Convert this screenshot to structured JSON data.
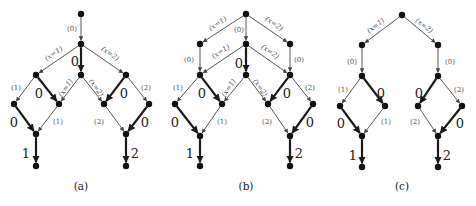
{
  "figure": {
    "panels": [
      {
        "id": "a",
        "caption": "(a)",
        "caption_pos": [
          81,
          187
        ],
        "nodes": [
          [
            81,
            14
          ],
          [
            81,
            44
          ],
          [
            36,
            75
          ],
          [
            81,
            75
          ],
          [
            126,
            75
          ],
          [
            14,
            104
          ],
          [
            59,
            104
          ],
          [
            104,
            104
          ],
          [
            149,
            104
          ],
          [
            36,
            134
          ],
          [
            126,
            134
          ],
          [
            36,
            166
          ],
          [
            126,
            166
          ]
        ],
        "edges": [
          {
            "from": 0,
            "to": 1,
            "w": "thin",
            "label": "(0)",
            "lx": 72,
            "ly": 29,
            "rot": 0,
            "size": "small"
          },
          {
            "from": 1,
            "to": 2,
            "w": "thin",
            "label": "(x=1)",
            "lx": 54,
            "ly": 54,
            "rot": -34,
            "size": "small"
          },
          {
            "from": 1,
            "to": 3,
            "w": "thick",
            "label": "0",
            "lx": 75,
            "ly": 62,
            "rot": 0,
            "size": "big"
          },
          {
            "from": 1,
            "to": 4,
            "w": "thin",
            "label": "(x=2)",
            "lx": 110,
            "ly": 54,
            "rot": 34,
            "size": "small"
          },
          {
            "from": 2,
            "to": 5,
            "w": "thin",
            "label": "(1)",
            "lx": 16,
            "ly": 88,
            "rot": 0,
            "size": "small"
          },
          {
            "from": 2,
            "to": 6,
            "w": "thick",
            "label": "0",
            "lx": 39,
            "ly": 94,
            "rot": 0,
            "size": "big"
          },
          {
            "from": 3,
            "to": 6,
            "w": "thin",
            "label": "(x=1)",
            "lx": 66,
            "ly": 88,
            "rot": -55,
            "size": "small"
          },
          {
            "from": 3,
            "to": 7,
            "w": "thin",
            "label": "(x=2)",
            "lx": 96,
            "ly": 88,
            "rot": 55,
            "size": "small"
          },
          {
            "from": 4,
            "to": 7,
            "w": "thick",
            "label": "0",
            "lx": 124,
            "ly": 94,
            "rot": 0,
            "size": "big"
          },
          {
            "from": 4,
            "to": 8,
            "w": "thin",
            "label": "(2)",
            "lx": 146,
            "ly": 88,
            "rot": 0,
            "size": "small"
          },
          {
            "from": 5,
            "to": 9,
            "w": "thick",
            "label": "0",
            "lx": 14,
            "ly": 123,
            "rot": 0,
            "size": "big"
          },
          {
            "from": 6,
            "to": 9,
            "w": "thin",
            "label": "(1)",
            "lx": 58,
            "ly": 122,
            "rot": 0,
            "size": "small"
          },
          {
            "from": 7,
            "to": 10,
            "w": "thin",
            "label": "(2)",
            "lx": 99,
            "ly": 122,
            "rot": 0,
            "size": "small"
          },
          {
            "from": 8,
            "to": 10,
            "w": "thick",
            "label": "0",
            "lx": 145,
            "ly": 123,
            "rot": 0,
            "size": "big"
          },
          {
            "from": 9,
            "to": 11,
            "w": "thick",
            "label": "1",
            "lx": 26,
            "ly": 154,
            "rot": 0,
            "size": "big"
          },
          {
            "from": 10,
            "to": 12,
            "w": "thick",
            "label": "2",
            "lx": 135,
            "ly": 154,
            "rot": 0,
            "size": "big"
          }
        ]
      },
      {
        "id": "b",
        "caption": "(b)",
        "caption_pos": [
          246,
          187
        ],
        "nodes": [
          [
            246,
            14
          ],
          [
            200,
            44
          ],
          [
            246,
            44
          ],
          [
            290,
            44
          ],
          [
            200,
            75
          ],
          [
            246,
            75
          ],
          [
            290,
            75
          ],
          [
            175,
            104
          ],
          [
            222,
            104
          ],
          [
            268,
            104
          ],
          [
            313,
            104
          ],
          [
            200,
            136
          ],
          [
            290,
            136
          ],
          [
            200,
            166
          ],
          [
            290,
            166
          ]
        ],
        "edges": [
          {
            "from": 0,
            "to": 1,
            "w": "thin",
            "label": "(x=1)",
            "lx": 218,
            "ly": 24,
            "rot": -34,
            "size": "small"
          },
          {
            "from": 0,
            "to": 2,
            "w": "thin",
            "label": "(0)",
            "lx": 239,
            "ly": 30,
            "rot": 0,
            "size": "small"
          },
          {
            "from": 0,
            "to": 3,
            "w": "thin",
            "label": "(x=2)",
            "lx": 274,
            "ly": 24,
            "rot": 34,
            "size": "small"
          },
          {
            "from": 1,
            "to": 4,
            "w": "thin",
            "label": "(0)",
            "lx": 189,
            "ly": 60,
            "rot": 0,
            "size": "small"
          },
          {
            "from": 2,
            "to": 4,
            "w": "thin",
            "label": "(x=1)",
            "lx": 221,
            "ly": 52,
            "rot": -34,
            "size": "small"
          },
          {
            "from": 2,
            "to": 5,
            "w": "thick",
            "label": "0",
            "lx": 239,
            "ly": 64,
            "rot": 0,
            "size": "big"
          },
          {
            "from": 2,
            "to": 6,
            "w": "thin",
            "label": "(x=2)",
            "lx": 270,
            "ly": 52,
            "rot": 34,
            "size": "small"
          },
          {
            "from": 3,
            "to": 6,
            "w": "thin",
            "label": "(0)",
            "lx": 299,
            "ly": 60,
            "rot": 0,
            "size": "small"
          },
          {
            "from": 4,
            "to": 7,
            "w": "thin",
            "label": "(1)",
            "lx": 178,
            "ly": 88,
            "rot": 0,
            "size": "small"
          },
          {
            "from": 4,
            "to": 8,
            "w": "thick",
            "label": "0",
            "lx": 202,
            "ly": 94,
            "rot": 0,
            "size": "big"
          },
          {
            "from": 5,
            "to": 8,
            "w": "thin",
            "label": "(x=1)",
            "lx": 229,
            "ly": 88,
            "rot": -55,
            "size": "small"
          },
          {
            "from": 5,
            "to": 9,
            "w": "thin",
            "label": "(x=2)",
            "lx": 260,
            "ly": 88,
            "rot": 55,
            "size": "small"
          },
          {
            "from": 6,
            "to": 9,
            "w": "thick",
            "label": "0",
            "lx": 287,
            "ly": 94,
            "rot": 0,
            "size": "big"
          },
          {
            "from": 6,
            "to": 10,
            "w": "thin",
            "label": "(2)",
            "lx": 310,
            "ly": 88,
            "rot": 0,
            "size": "small"
          },
          {
            "from": 7,
            "to": 11,
            "w": "thick",
            "label": "0",
            "lx": 175,
            "ly": 123,
            "rot": 0,
            "size": "big"
          },
          {
            "from": 8,
            "to": 11,
            "w": "thin",
            "label": "(1)",
            "lx": 222,
            "ly": 122,
            "rot": 0,
            "size": "small"
          },
          {
            "from": 9,
            "to": 12,
            "w": "thin",
            "label": "(2)",
            "lx": 267,
            "ly": 122,
            "rot": 0,
            "size": "small"
          },
          {
            "from": 10,
            "to": 12,
            "w": "thick",
            "label": "0",
            "lx": 310,
            "ly": 123,
            "rot": 0,
            "size": "big"
          },
          {
            "from": 11,
            "to": 13,
            "w": "thick",
            "label": "1",
            "lx": 190,
            "ly": 154,
            "rot": 0,
            "size": "big"
          },
          {
            "from": 12,
            "to": 14,
            "w": "thick",
            "label": "2",
            "lx": 299,
            "ly": 154,
            "rot": 0,
            "size": "big"
          }
        ]
      },
      {
        "id": "c",
        "caption": "(c)",
        "caption_pos": [
          402,
          187
        ],
        "nodes": [
          [
            402,
            15
          ],
          [
            362,
            45
          ],
          [
            438,
            45
          ],
          [
            362,
            76
          ],
          [
            438,
            76
          ],
          [
            340,
            106
          ],
          [
            385,
            106
          ],
          [
            418,
            106
          ],
          [
            462,
            106
          ],
          [
            362,
            136
          ],
          [
            438,
            136
          ],
          [
            362,
            167
          ],
          [
            438,
            167
          ]
        ],
        "edges": [
          {
            "from": 0,
            "to": 1,
            "w": "thin",
            "label": "(x=1)",
            "lx": 376,
            "ly": 26,
            "rot": -38,
            "size": "small"
          },
          {
            "from": 0,
            "to": 2,
            "w": "thin",
            "label": "(x=2)",
            "lx": 424,
            "ly": 26,
            "rot": 38,
            "size": "small"
          },
          {
            "from": 1,
            "to": 3,
            "w": "thin",
            "label": "(0)",
            "lx": 352,
            "ly": 62,
            "rot": 0,
            "size": "small"
          },
          {
            "from": 2,
            "to": 4,
            "w": "thin",
            "label": "(0)",
            "lx": 450,
            "ly": 62,
            "rot": 0,
            "size": "small"
          },
          {
            "from": 3,
            "to": 5,
            "w": "thin",
            "label": "(1)",
            "lx": 343,
            "ly": 90,
            "rot": 0,
            "size": "small"
          },
          {
            "from": 3,
            "to": 6,
            "w": "thick",
            "label": "0",
            "lx": 381,
            "ly": 94,
            "rot": 0,
            "size": "big"
          },
          {
            "from": 4,
            "to": 7,
            "w": "thick",
            "label": "0",
            "lx": 419,
            "ly": 94,
            "rot": 0,
            "size": "big"
          },
          {
            "from": 4,
            "to": 8,
            "w": "thin",
            "label": "(2)",
            "lx": 459,
            "ly": 90,
            "rot": 0,
            "size": "small"
          },
          {
            "from": 5,
            "to": 9,
            "w": "thick",
            "label": "0",
            "lx": 341,
            "ly": 124,
            "rot": 0,
            "size": "big"
          },
          {
            "from": 6,
            "to": 9,
            "w": "thin",
            "label": "(1)",
            "lx": 386,
            "ly": 122,
            "rot": 0,
            "size": "small"
          },
          {
            "from": 7,
            "to": 10,
            "w": "thin",
            "label": "(2)",
            "lx": 415,
            "ly": 122,
            "rot": 0,
            "size": "small"
          },
          {
            "from": 8,
            "to": 10,
            "w": "thick",
            "label": "0",
            "lx": 460,
            "ly": 124,
            "rot": 0,
            "size": "big"
          },
          {
            "from": 9,
            "to": 11,
            "w": "thick",
            "label": "1",
            "lx": 353,
            "ly": 156,
            "rot": 0,
            "size": "big"
          },
          {
            "from": 10,
            "to": 12,
            "w": "thick",
            "label": "2",
            "lx": 447,
            "ly": 156,
            "rot": 0,
            "size": "big"
          }
        ]
      }
    ]
  },
  "colors": {
    "node": "#111111",
    "thin_edge": "#444444",
    "thick_edge": "#1a1a1a",
    "background": "#ffffff"
  }
}
